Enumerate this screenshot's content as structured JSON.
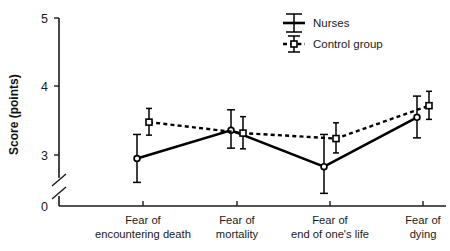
{
  "chart_data": {
    "type": "line",
    "title": "",
    "xlabel": "",
    "ylabel": "Score (points)",
    "ylim": [
      2.6,
      5.0
    ],
    "y_ticks": [
      3,
      4,
      5
    ],
    "y_tick_labels": [
      "3",
      "4",
      "5"
    ],
    "y_origin_label": "0",
    "axis_break": true,
    "grid": false,
    "legend_position": "top-right",
    "categories": [
      "Fear of encountering death",
      "Fear of mortality",
      "Fear of end of one's life",
      "Fear of dying"
    ],
    "category_lines": [
      [
        "Fear of",
        "encountering death"
      ],
      [
        "Fear of",
        "mortality"
      ],
      [
        "Fear of",
        "end of one's life"
      ],
      [
        "Fear of",
        "dying"
      ]
    ],
    "series": [
      {
        "name": "Nurses",
        "marker": "circle",
        "line_style": "solid",
        "color": "#000000",
        "values": [
          2.95,
          3.36,
          2.83,
          3.55
        ],
        "err_low": [
          2.6,
          3.1,
          2.44,
          3.25
        ],
        "err_high": [
          3.3,
          3.66,
          3.3,
          3.86
        ]
      },
      {
        "name": "Control group",
        "marker": "square",
        "line_style": "dashed",
        "color": "#000000",
        "values": [
          3.48,
          3.32,
          3.24,
          3.72
        ],
        "err_low": [
          3.29,
          3.09,
          3.03,
          3.52
        ],
        "err_high": [
          3.68,
          3.56,
          3.47,
          3.93
        ]
      }
    ]
  },
  "legend": {
    "items": [
      {
        "label": "Nurses",
        "marker": "solid-line-errorbar"
      },
      {
        "label": "Control group",
        "marker": "dashed-line-square-errorbar"
      }
    ]
  },
  "axes": {
    "y_title": "Score (points)",
    "y_labels": [
      "5",
      "4",
      "3",
      "0"
    ]
  }
}
